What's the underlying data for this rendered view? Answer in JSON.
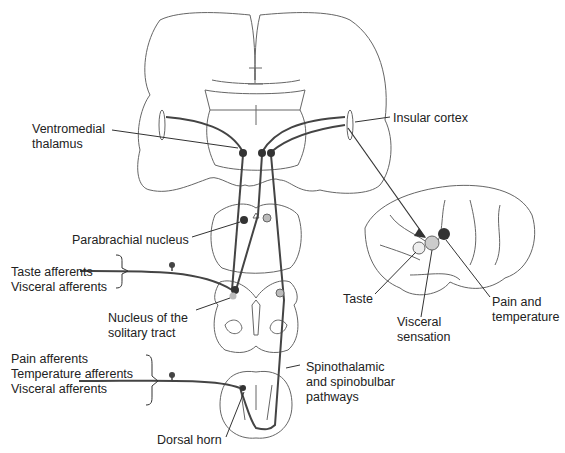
{
  "diagram": {
    "type": "neuroanatomy pathway diagram",
    "labels": {
      "ventromedial_thalamus_1": "Ventromedial",
      "ventromedial_thalamus_2": "thalamus",
      "insular_cortex": "Insular cortex",
      "parabrachial_nucleus": "Parabrachial nucleus",
      "taste_afferents": "Taste afferents",
      "visceral_afferents_1": "Visceral afferents",
      "nts_1": "Nucleus of the",
      "nts_2": "solitary tract",
      "pain_afferents": "Pain afferents",
      "temperature_afferents": "Temperature afferents",
      "visceral_afferents_2": "Visceral afferents",
      "spinothalamic_1": "Spinothalamic",
      "spinothalamic_2": "and spinobulbar",
      "spinothalamic_3": "pathways",
      "dorsal_horn": "Dorsal horn",
      "taste": "Taste",
      "visceral_sensation_1": "Visceral",
      "visceral_sensation_2": "sensation",
      "pain_temp_1": "Pain and",
      "pain_temp_2": "temperature"
    },
    "colors": {
      "outline": "#555555",
      "pathway": "#444444",
      "dark_nucleus": "#333333",
      "light_nucleus": "#bbbbbb",
      "taste_spot": "#eeeeee",
      "visceral_spot": "#cccccc",
      "pain_spot": "#333333"
    }
  }
}
